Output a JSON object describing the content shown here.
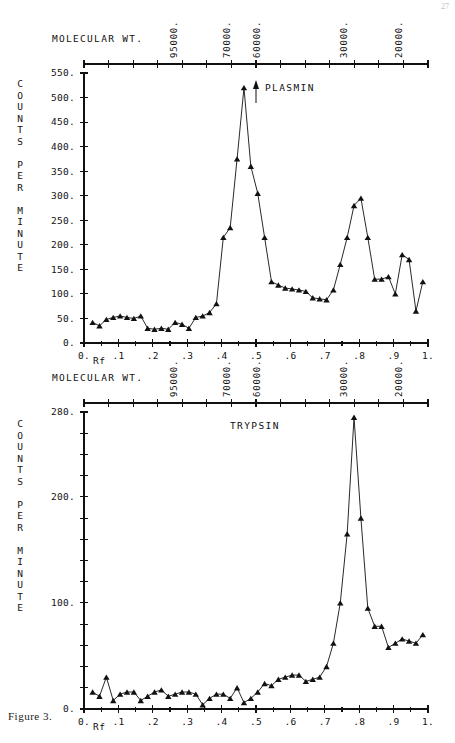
{
  "page": {
    "page_number": "27",
    "figure_caption": "Figure 3."
  },
  "axis_titles": {
    "molecular_weight": "MOLECULAR WT.",
    "rf": "Rf",
    "counts_chars": [
      "C",
      "O",
      "U",
      "N",
      "T",
      "S",
      "",
      "P",
      "E",
      "R",
      "",
      "M",
      "I",
      "N",
      "U",
      "T",
      "E"
    ]
  },
  "molecular_weight_axis": {
    "labels": [
      "95000.",
      "70000.",
      "60000.",
      "30000.",
      "20000."
    ],
    "rf_positions": [
      0.26,
      0.415,
      0.5,
      0.755,
      0.915
    ],
    "minor_tick_count": 14
  },
  "chart_data": [
    {
      "type": "line",
      "title": "PLASMIN",
      "xlabel": "Rf",
      "ylabel": "COUNTS PER MINUTE",
      "xlim": [
        0,
        1
      ],
      "ylim": [
        0,
        550
      ],
      "xticks": [
        0,
        0.1,
        0.2,
        0.3,
        0.4,
        0.5,
        0.6,
        0.7,
        0.8,
        0.9,
        1.0
      ],
      "xticklabels": [
        "0.",
        ".1",
        ".2",
        ".3",
        ".4",
        ".5",
        ".6",
        ".7",
        ".8",
        ".9",
        "1."
      ],
      "yticks": [
        0,
        50,
        100,
        150,
        200,
        250,
        300,
        350,
        400,
        450,
        500,
        550
      ],
      "yticklabels": [
        "0.",
        "50.",
        "100.",
        "150.",
        "200.",
        "250.",
        "300.",
        "350.",
        "400.",
        "450.",
        "500.",
        "550."
      ],
      "grid": false,
      "marker": "triangle",
      "annotation_arrow_rf": 0.5,
      "x": [
        0.025,
        0.045,
        0.065,
        0.085,
        0.105,
        0.125,
        0.145,
        0.165,
        0.185,
        0.205,
        0.225,
        0.245,
        0.265,
        0.285,
        0.305,
        0.325,
        0.345,
        0.365,
        0.385,
        0.405,
        0.425,
        0.445,
        0.465,
        0.485,
        0.505,
        0.525,
        0.545,
        0.565,
        0.585,
        0.605,
        0.625,
        0.645,
        0.665,
        0.685,
        0.705,
        0.725,
        0.745,
        0.765,
        0.785,
        0.805,
        0.825,
        0.845,
        0.865,
        0.885,
        0.905,
        0.925,
        0.945,
        0.965,
        0.985
      ],
      "y": [
        42,
        35,
        48,
        52,
        55,
        52,
        50,
        55,
        30,
        28,
        30,
        28,
        42,
        38,
        30,
        52,
        55,
        62,
        80,
        215,
        235,
        375,
        520,
        360,
        305,
        215,
        125,
        118,
        112,
        110,
        108,
        105,
        92,
        90,
        88,
        108,
        160,
        215,
        280,
        295,
        215,
        130,
        130,
        135,
        100,
        180,
        170,
        65,
        125
      ]
    },
    {
      "type": "line",
      "title": "TRYPSIN",
      "xlabel": "Rf",
      "ylabel": "COUNTS PER MINUTE",
      "xlim": [
        0,
        1
      ],
      "ylim": [
        0,
        280
      ],
      "xticks": [
        0,
        0.1,
        0.2,
        0.3,
        0.4,
        0.5,
        0.6,
        0.7,
        0.8,
        0.9,
        1.0
      ],
      "xticklabels": [
        "0.",
        ".1",
        ".2",
        ".3",
        ".4",
        ".5",
        ".6",
        ".7",
        ".8",
        ".9",
        "1."
      ],
      "yticks": [
        0,
        20,
        40,
        60,
        80,
        100,
        120,
        140,
        160,
        180,
        200,
        220,
        240,
        260,
        280
      ],
      "yticklabels_major": {
        "0": "0.",
        "100": "100.",
        "200": "200.",
        "280": "280."
      },
      "grid": false,
      "marker": "triangle",
      "x": [
        0.025,
        0.045,
        0.065,
        0.085,
        0.105,
        0.125,
        0.145,
        0.165,
        0.185,
        0.205,
        0.225,
        0.245,
        0.265,
        0.285,
        0.305,
        0.325,
        0.345,
        0.365,
        0.385,
        0.405,
        0.425,
        0.445,
        0.465,
        0.485,
        0.505,
        0.525,
        0.545,
        0.565,
        0.585,
        0.605,
        0.625,
        0.645,
        0.665,
        0.685,
        0.705,
        0.725,
        0.745,
        0.765,
        0.785,
        0.805,
        0.825,
        0.845,
        0.865,
        0.885,
        0.905,
        0.925,
        0.945,
        0.965,
        0.985
      ],
      "y": [
        16,
        12,
        30,
        8,
        14,
        16,
        16,
        8,
        12,
        16,
        18,
        12,
        14,
        16,
        16,
        14,
        4,
        10,
        14,
        14,
        10,
        20,
        6,
        10,
        16,
        24,
        22,
        28,
        30,
        32,
        32,
        26,
        28,
        30,
        40,
        62,
        100,
        165,
        275,
        180,
        95,
        78,
        78,
        58,
        62,
        66,
        64,
        62,
        70
      ]
    }
  ]
}
